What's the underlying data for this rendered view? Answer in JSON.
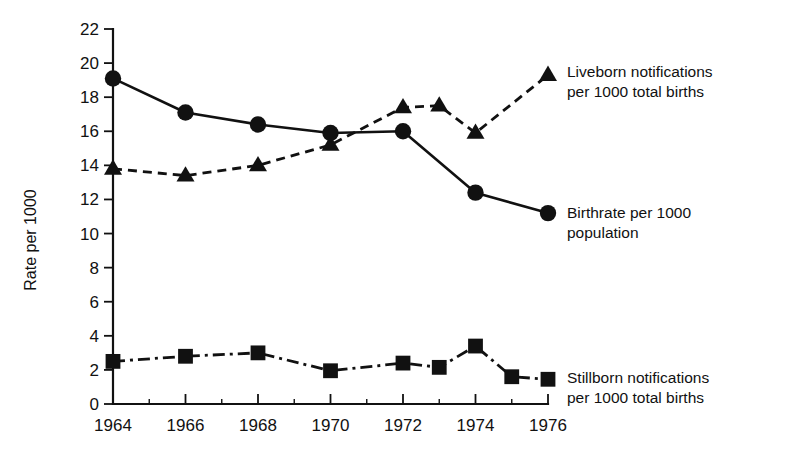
{
  "chart_data": {
    "type": "line",
    "title": "",
    "xlabel": "",
    "ylabel": "Rate per 1000",
    "xlim": [
      1964,
      1976
    ],
    "ylim": [
      0,
      22
    ],
    "grid": false,
    "legend_position": "right-inline",
    "y_ticks": [
      0,
      2,
      4,
      6,
      8,
      10,
      12,
      14,
      16,
      18,
      20,
      22
    ],
    "y_tick_labels": [
      "0",
      "2",
      "4",
      "6",
      "8",
      "10",
      "12",
      "14",
      "16",
      "18",
      "20",
      "22"
    ],
    "x_ticks": [
      1964,
      1965,
      1966,
      1967,
      1968,
      1969,
      1970,
      1971,
      1972,
      1973,
      1974,
      1975,
      1976
    ],
    "x_tick_labels_shown": [
      "1964",
      "1966",
      "1968",
      "1970",
      "1972",
      "1974",
      "1976"
    ],
    "x_labeled_ticks": [
      1964,
      1966,
      1968,
      1970,
      1972,
      1974,
      1976
    ],
    "series": [
      {
        "name": "Liveborn notifications per 1000 total births",
        "marker": "triangle",
        "linestyle": "dashed",
        "color": "#111111",
        "x": [
          1964,
          1966,
          1968,
          1970,
          1972,
          1973,
          1974,
          1976
        ],
        "values": [
          13.8,
          13.4,
          14.0,
          15.2,
          17.4,
          17.5,
          15.9,
          19.3
        ]
      },
      {
        "name": "Birthrate per 1000 population",
        "marker": "circle",
        "linestyle": "solid",
        "color": "#111111",
        "x": [
          1964,
          1966,
          1968,
          1970,
          1972,
          1974,
          1976
        ],
        "values": [
          19.1,
          17.1,
          16.4,
          15.9,
          16.0,
          12.4,
          11.2
        ]
      },
      {
        "name": "Stillborn notifications per 1000 total births",
        "marker": "square",
        "linestyle": "dashdot",
        "color": "#111111",
        "x": [
          1964,
          1966,
          1968,
          1970,
          1972,
          1973,
          1974,
          1975,
          1976
        ],
        "values": [
          2.5,
          2.8,
          3.0,
          1.95,
          2.4,
          2.15,
          3.4,
          1.6,
          1.45
        ]
      }
    ]
  },
  "legend": {
    "liveborn": {
      "line1": "Liveborn notifications",
      "line2": "per 1000 total births"
    },
    "birthrate": {
      "line1": "Birthrate per 1000",
      "line2": "population"
    },
    "stillborn": {
      "line1": "Stillborn notifications",
      "line2": "per 1000 total births"
    }
  },
  "axes": {
    "y_title": "Rate per 1000"
  }
}
